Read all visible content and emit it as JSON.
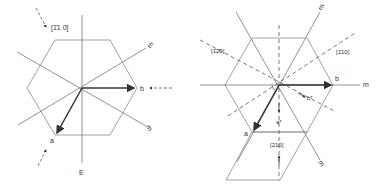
{
  "diagram_left": {
    "direction_label": "[1̄1 0]",
    "vector_a": "a",
    "vector_b": "b",
    "mirror_label_1": "m",
    "mirror_label_2": "m",
    "bottom_label": "E"
  },
  "diagram_right": {
    "direction_label_left": "[1̄2̄0]",
    "direction_label_right": "[1̄10]",
    "direction_label_bottom": "[210]",
    "vector_a": "a",
    "vector_b": "b",
    "vector_a_star": "a*",
    "vector_b_star": "b*",
    "mirror_label_top": "m",
    "mirror_label_right": "m",
    "mirror_label_bottom": "m",
    "angle_label": "ψ"
  },
  "colors": {
    "line": "#8a8a8a",
    "bold_vector": "#333333",
    "text": "#333333"
  }
}
